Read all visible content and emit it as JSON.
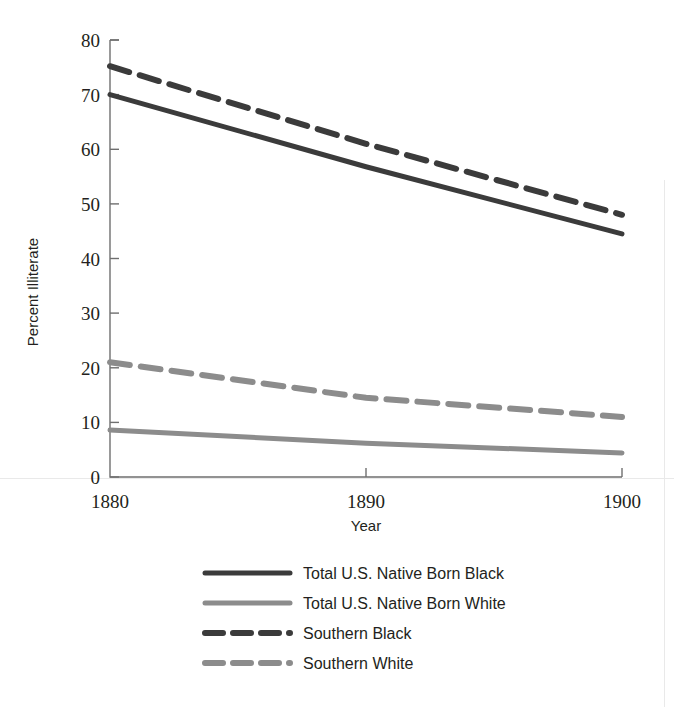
{
  "chart_data": {
    "type": "line",
    "title": "",
    "subtitle": "",
    "xlabel": "Year",
    "ylabel": "Percent Illiterate",
    "x": [
      1880,
      1890,
      1900
    ],
    "xticklabels": [
      "1880",
      "1890",
      "1900"
    ],
    "yticklabels": [
      "0",
      "10",
      "20",
      "30",
      "40",
      "50",
      "60",
      "70",
      "80"
    ],
    "yticks": [
      0,
      10,
      20,
      30,
      40,
      50,
      60,
      70,
      80
    ],
    "xlim": [
      1880,
      1900
    ],
    "ylim": [
      0,
      80
    ],
    "grid": false,
    "legend_position": "below",
    "series": [
      {
        "name": "Total U.S. Native Born Black",
        "values": [
          70.0,
          56.8,
          44.5
        ],
        "color": "#3b3b3b",
        "style": "solid",
        "width": 5
      },
      {
        "name": "Total U.S. Native Born White",
        "values": [
          8.6,
          6.2,
          4.4
        ],
        "color": "#8c8c8c",
        "style": "solid",
        "width": 5
      },
      {
        "name": "Southern Black",
        "values": [
          75.2,
          61.0,
          48.0
        ],
        "color": "#3b3b3b",
        "style": "dashed",
        "width": 6
      },
      {
        "name": "Southern White",
        "values": [
          21.0,
          14.5,
          11.0
        ],
        "color": "#8c8c8c",
        "style": "dashed",
        "width": 6
      }
    ]
  },
  "axis": {
    "ylabel": "Percent Illiterate",
    "xlabel": "Year",
    "ytick_0": "0",
    "ytick_10": "10",
    "ytick_20": "20",
    "ytick_30": "30",
    "ytick_40": "40",
    "ytick_50": "50",
    "ytick_60": "60",
    "ytick_70": "70",
    "ytick_80": "80",
    "xtick_1880": "1880",
    "xtick_1890": "1890",
    "xtick_1900": "1900"
  },
  "legend": {
    "items": [
      {
        "label": "Total U.S. Native Born Black"
      },
      {
        "label": "Total U.S. Native Born White"
      },
      {
        "label": "Southern Black"
      },
      {
        "label": "Southern White"
      }
    ]
  },
  "colors": {
    "dark_series": "#3b3b3b",
    "light_series": "#8c8c8c",
    "axis": "#6f6f6f",
    "text": "#231f20",
    "background": "#ffffff"
  }
}
